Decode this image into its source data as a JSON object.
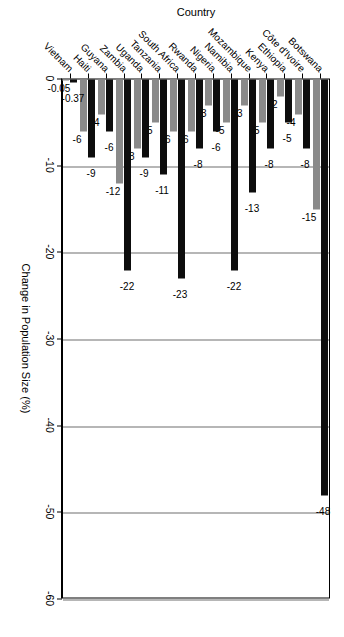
{
  "chart_data": {
    "type": "bar",
    "orientation": "horizontal",
    "title": "",
    "xlabel": "Change in Population Size (%)",
    "ylabel": "Country",
    "xlim": [
      0,
      -60
    ],
    "xticks": [
      0,
      -10,
      -20,
      -30,
      -40,
      -50,
      -60
    ],
    "xticklabels": [
      "0",
      "-10",
      "-20",
      "-30",
      "-40",
      "-50",
      "-60"
    ],
    "grid": true,
    "grid_axis": "x",
    "legend": "none",
    "categories": [
      "Botswana",
      "Côte d'Ivoire",
      "Ethiopia",
      "Kenya",
      "Mozambique",
      "Namibia",
      "Nigeria",
      "Rwanda",
      "South Africa",
      "Tanzania",
      "Uganda",
      "Zambia",
      "Guyana",
      "Haiti",
      "Vietnam"
    ],
    "series": [
      {
        "name": "series-black",
        "color": "#0d0d0d",
        "values": [
          -48,
          -8,
          -5,
          -8,
          -13,
          -22,
          -6,
          -8,
          -23,
          -11,
          -9,
          -22,
          -6,
          -9,
          -0.37
        ],
        "labels": [
          "-48",
          "-8",
          "-5",
          "-8",
          "-13",
          "-22",
          "-6",
          "-8",
          "-23",
          "-11",
          "-9",
          "-22",
          "-6",
          "-9",
          "-0.37"
        ]
      },
      {
        "name": "series-gray",
        "color": "#8a8a8a",
        "values": [
          -15,
          -4,
          -2,
          -5,
          -3,
          -5,
          -3,
          -6,
          -6,
          -5,
          -8,
          -12,
          -4,
          -6,
          -0.05
        ],
        "labels": [
          "-15",
          "-4",
          "-2",
          "-5",
          "-3",
          "-5",
          "-3",
          "-6",
          "-6",
          "-5",
          "-8",
          "-12",
          "-4",
          "-6",
          "-0.05"
        ]
      }
    ]
  }
}
